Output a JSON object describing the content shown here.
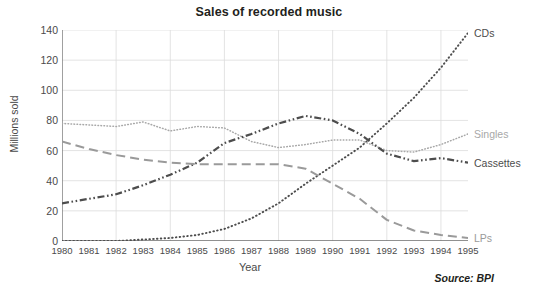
{
  "chart_data": {
    "type": "line",
    "title": "Sales of recorded music",
    "xlabel": "Year",
    "ylabel": "Millions sold",
    "source": "Source: BPI",
    "grid": true,
    "legend_position": "right-of-plot",
    "xlim": [
      1980,
      1995
    ],
    "ylim": [
      0,
      140
    ],
    "ytick_values": [
      0,
      20,
      40,
      60,
      80,
      100,
      120,
      140
    ],
    "ytick_labels": [
      "0",
      "20",
      "40",
      "60",
      "80",
      "100",
      "120",
      "140"
    ],
    "categories": [
      1980,
      1981,
      1982,
      1983,
      1984,
      1985,
      1986,
      1987,
      1988,
      1989,
      1990,
      1991,
      1992,
      1993,
      1994,
      1995
    ],
    "xtick_labels": [
      "1980",
      "1981",
      "1982",
      "1983",
      "1984",
      "1985",
      "1986",
      "1987",
      "1988",
      "1989",
      "1990",
      "1991",
      "1992",
      "1993",
      "1994",
      "1995"
    ],
    "series": [
      {
        "name": "CDs",
        "color": "#4d4d4d",
        "dash": "dotted",
        "label_value": 138,
        "values": [
          0,
          0,
          0,
          1,
          2,
          4,
          8,
          15,
          25,
          38,
          50,
          62,
          78,
          95,
          115,
          138
        ]
      },
      {
        "name": "Singles",
        "color": "#a8a8a8",
        "dash": "fine-dotted",
        "label_value": 71,
        "values": [
          78,
          77,
          76,
          79,
          73,
          76,
          75,
          66,
          62,
          64,
          67,
          67,
          60,
          59,
          64,
          71
        ]
      },
      {
        "name": "Cassettes",
        "color": "#4d4d4d",
        "dash": "dash-dot-dot",
        "label_value": 52,
        "values": [
          25,
          28,
          31,
          37,
          44,
          52,
          65,
          71,
          78,
          83,
          80,
          71,
          58,
          53,
          55,
          52
        ]
      },
      {
        "name": "LPs",
        "color": "#9a9a9a",
        "dash": "long-dash",
        "label_value": 2,
        "values": [
          66,
          61,
          57,
          54,
          52,
          51,
          51,
          51,
          51,
          48,
          38,
          28,
          14,
          7,
          4,
          2
        ]
      }
    ]
  }
}
